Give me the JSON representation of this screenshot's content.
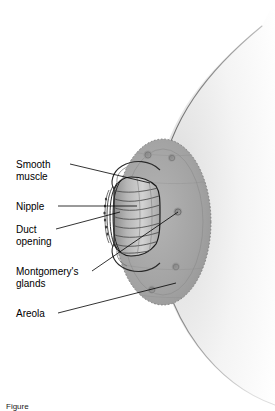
{
  "figure": {
    "view": "cross-sectional / surface view of breast nipple region",
    "background_color": "#ffffff",
    "ink_color": "#000000",
    "tissue_color": "#9a9a9a",
    "areola_color": "#a6a6a6",
    "breast_fill_color": "#f2f2f2",
    "labels": [
      {
        "id": "smooth-muscle",
        "text": "Smooth\nmuscle",
        "x": 16,
        "y": 159
      },
      {
        "id": "nipple",
        "text": "Nipple",
        "x": 16,
        "y": 201
      },
      {
        "id": "duct-opening",
        "text": "Duct\nopening",
        "x": 16,
        "y": 224
      },
      {
        "id": "montgomerys-glands",
        "text": "Montgomery's\nglands",
        "x": 16,
        "y": 266
      },
      {
        "id": "areola",
        "text": "Areola",
        "x": 16,
        "y": 308
      }
    ],
    "leader_lines": [
      {
        "id": "leader-smooth-muscle",
        "from": [
          70,
          164
        ],
        "to": [
          150,
          183
        ]
      },
      {
        "id": "leader-nipple",
        "from": [
          58,
          206
        ],
        "to": [
          137,
          206
        ]
      },
      {
        "id": "leader-duct-opening",
        "from": [
          56,
          229
        ],
        "to": [
          120,
          212
        ]
      },
      {
        "id": "leader-montgomerys-glands",
        "from": [
          92,
          271
        ],
        "to": [
          178,
          212
        ]
      },
      {
        "id": "leader-areola",
        "from": [
          58,
          313
        ],
        "to": [
          176,
          283
        ]
      }
    ],
    "structures": [
      {
        "id": "breast-dome",
        "label": "breast surface"
      },
      {
        "id": "areola-disc",
        "label": "areola"
      },
      {
        "id": "nipple-body",
        "label": "nipple"
      },
      {
        "id": "smooth-muscle-band",
        "label": "smooth muscle"
      },
      {
        "id": "duct-openings",
        "label": "duct openings"
      },
      {
        "id": "montgomery-gland",
        "label": "Montgomery's gland"
      }
    ],
    "montgomery_glands": [
      {
        "cx": 148,
        "cy": 155,
        "r": 4.6
      },
      {
        "cx": 172,
        "cy": 158,
        "r": 4.2
      },
      {
        "cx": 178,
        "cy": 212,
        "r": 4.6
      },
      {
        "cx": 176,
        "cy": 267,
        "r": 4.4
      },
      {
        "cx": 152,
        "cy": 290,
        "r": 4.4
      }
    ],
    "caption": "Figure"
  }
}
